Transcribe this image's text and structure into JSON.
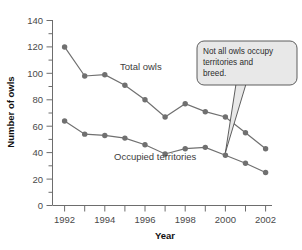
{
  "chart_data": {
    "type": "line",
    "title": "",
    "xlabel": "Year",
    "ylabel": "Number of owls",
    "xlim": [
      1992,
      2002
    ],
    "ylim": [
      0,
      140
    ],
    "x": [
      1992,
      1993,
      1994,
      1995,
      1996,
      1997,
      1998,
      1999,
      2000,
      2001,
      2002
    ],
    "xticklabels": [
      "1992",
      "1994",
      "1996",
      "1998",
      "2000",
      "2002"
    ],
    "xtickvalues": [
      1992,
      1994,
      1996,
      1998,
      2000,
      2002
    ],
    "yticklabels": [
      "0",
      "20",
      "40",
      "60",
      "80",
      "100",
      "120",
      "140"
    ],
    "ytickvalues": [
      0,
      20,
      40,
      60,
      80,
      100,
      120,
      140
    ],
    "y_minor_step": 10,
    "grid": false,
    "legend": "inline-labels",
    "series": [
      {
        "name": "Total owls",
        "color": "#707070",
        "marker": "circle",
        "values": [
          120,
          98,
          99,
          91,
          80,
          67,
          77,
          71,
          67,
          55,
          43
        ]
      },
      {
        "name": "Occupied territories",
        "color": "#707070",
        "marker": "circle",
        "values": [
          64,
          54,
          53,
          51,
          46,
          39,
          43,
          44,
          38,
          32,
          25
        ]
      }
    ],
    "annotations": [
      {
        "name": "callout",
        "text": "Not all owls occupy territories and breed.",
        "lines": [
          "Not all owls occupy",
          "territories and",
          "breed."
        ],
        "target_x": 2000,
        "target_y": 67,
        "fill": "#e8e8e8"
      }
    ]
  },
  "labels": {
    "series_total": "Total owls",
    "series_occupied": "Occupied territories",
    "axis_x": "Year",
    "axis_y": "Number of owls"
  },
  "callout": {
    "line1": "Not all owls occupy",
    "line2": "territories and",
    "line3": "breed."
  },
  "yticks": {
    "t0": "0",
    "t1": "20",
    "t2": "40",
    "t3": "60",
    "t4": "80",
    "t5": "100",
    "t6": "120",
    "t7": "140"
  },
  "xticks": {
    "t0": "1992",
    "t1": "1994",
    "t2": "1996",
    "t3": "1998",
    "t4": "2000",
    "t5": "2002"
  }
}
